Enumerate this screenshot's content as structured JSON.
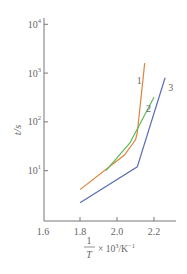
{
  "chart_data": {
    "type": "line",
    "title": "",
    "xlabel": "1/T × 10³/K⁻¹",
    "ylabel": "t/s",
    "xscale": "linear",
    "yscale": "log",
    "xlim": [
      1.6,
      2.32
    ],
    "ylim": [
      1,
      10000
    ],
    "x_ticks": [
      1.6,
      1.8,
      2.0,
      2.2
    ],
    "x_tick_labels": [
      "1.6",
      "1.8",
      "2.0",
      "2.2"
    ],
    "y_ticks": [
      10,
      100,
      1000,
      10000
    ],
    "y_tick_labels": [
      {
        "base": "10",
        "exp": "1"
      },
      {
        "base": "10",
        "exp": "2"
      },
      {
        "base": "10",
        "exp": "3"
      },
      {
        "base": "10",
        "exp": "4"
      }
    ],
    "grid": false,
    "legend": "inline curve labels",
    "series": [
      {
        "name": "1",
        "color": "#e0833a",
        "x": [
          1.8,
          2.04,
          2.1,
          2.11,
          2.15
        ],
        "y": [
          4.1,
          21,
          43,
          60,
          1600
        ],
        "label_pos": {
          "x": 2.12,
          "y": 600
        }
      },
      {
        "name": "2",
        "color": "#5cb85c",
        "x": [
          1.94,
          2.07,
          2.2
        ],
        "y": [
          10,
          37,
          320
        ],
        "label_pos": {
          "x": 2.17,
          "y": 160
        }
      },
      {
        "name": "3",
        "color": "#5a6fb5",
        "x": [
          1.8,
          2.11,
          2.26
        ],
        "y": [
          2.2,
          12,
          800
        ],
        "label_pos": {
          "x": 2.29,
          "y": 420
        }
      }
    ]
  }
}
